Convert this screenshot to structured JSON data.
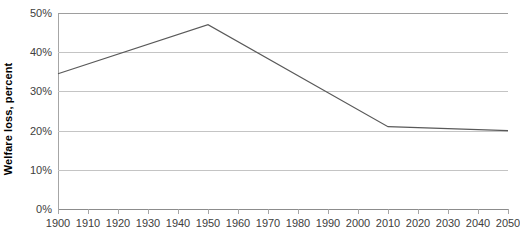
{
  "chart_data": {
    "type": "line",
    "title": "",
    "xlabel": "",
    "ylabel": "Welfare loss, percent",
    "x": [
      1900,
      1950,
      2010,
      2050
    ],
    "series": [
      {
        "name": "Welfare loss",
        "values": [
          34.5,
          47.0,
          21.0,
          20.0
        ],
        "color": "#595959"
      }
    ],
    "xlim": [
      1900,
      2050
    ],
    "ylim": [
      0,
      50
    ],
    "xticks": [
      1900,
      1910,
      1920,
      1930,
      1940,
      1950,
      1960,
      1970,
      1980,
      1990,
      2000,
      2010,
      2020,
      2030,
      2040,
      2050
    ],
    "xtick_labels": [
      "1900",
      "1910",
      "1920",
      "1930",
      "1940",
      "1950",
      "1960",
      "1970",
      "1980",
      "1990",
      "2000",
      "2010",
      "2020",
      "2030",
      "2040",
      "2050"
    ],
    "yticks": [
      0,
      10,
      20,
      30,
      40,
      50
    ],
    "ytick_labels": [
      "0%",
      "10%",
      "20%",
      "30%",
      "40%",
      "50%"
    ],
    "grid": true,
    "grid_axis": "y",
    "grid_color": "#c4c4c4",
    "legend": false,
    "legend_position": "none",
    "axis_color": "#a6a6a6",
    "tick_label_color": "#404040",
    "background": "#ffffff"
  }
}
